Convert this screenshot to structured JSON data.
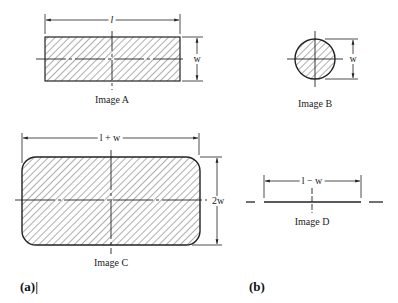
{
  "figure": {
    "panels": [
      {
        "id": "a",
        "label": "(a)|"
      },
      {
        "id": "b",
        "label": "(b)"
      }
    ],
    "shapes": [
      {
        "id": "A",
        "caption": "Image A",
        "type": "rectangle",
        "dimensions": {
          "horizontal": "l",
          "vertical": "w"
        }
      },
      {
        "id": "B",
        "caption": "Image B",
        "type": "circle",
        "dimensions": {
          "vertical": "w"
        }
      },
      {
        "id": "C",
        "caption": "Image C",
        "type": "rounded-rectangle",
        "dimensions": {
          "horizontal": "l + w",
          "vertical": "2w"
        }
      },
      {
        "id": "D",
        "caption": "Image D",
        "type": "line-segment",
        "dimensions": {
          "horizontal": "l − w"
        }
      }
    ],
    "colors": {
      "stroke": "#222222",
      "hatch": "#333333",
      "background": "#ffffff"
    }
  }
}
